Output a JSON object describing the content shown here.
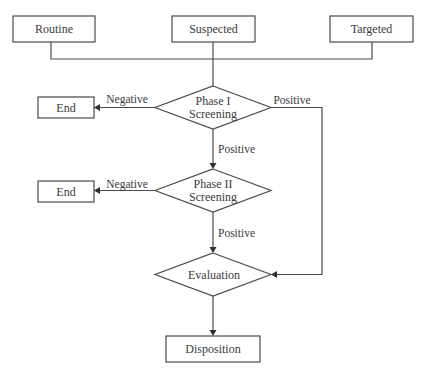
{
  "diagram": {
    "type": "flowchart",
    "colors": {
      "stroke": "#4a4a4a",
      "text": "#3a3a3a",
      "background": "#ffffff"
    },
    "nodes": {
      "routine": {
        "label": "Routine",
        "shape": "rectangle"
      },
      "suspected": {
        "label": "Suspected",
        "shape": "rectangle"
      },
      "targeted": {
        "label": "Targeted",
        "shape": "rectangle"
      },
      "phase1": {
        "line1": "Phase I",
        "line2": "Screening",
        "shape": "diamond"
      },
      "end1": {
        "label": "End",
        "shape": "rectangle"
      },
      "phase2": {
        "line1": "Phase II",
        "line2": "Screening",
        "shape": "diamond"
      },
      "end2": {
        "label": "End",
        "shape": "rectangle"
      },
      "evaluation": {
        "label": "Evaluation",
        "shape": "diamond"
      },
      "disposition": {
        "label": "Disposition",
        "shape": "rectangle"
      }
    },
    "edges": {
      "phase1_negative": {
        "from": "phase1",
        "to": "end1",
        "label": "Negative"
      },
      "phase1_positive_right": {
        "from": "phase1",
        "to": "evaluation",
        "label": "Positive"
      },
      "phase1_positive_down": {
        "from": "phase1",
        "to": "phase2",
        "label": "Positive"
      },
      "phase2_negative": {
        "from": "phase2",
        "to": "end2",
        "label": "Negative"
      },
      "phase2_positive": {
        "from": "phase2",
        "to": "evaluation",
        "label": "Positive"
      },
      "evaluation_to_disposition": {
        "from": "evaluation",
        "to": "disposition",
        "label": ""
      }
    }
  }
}
